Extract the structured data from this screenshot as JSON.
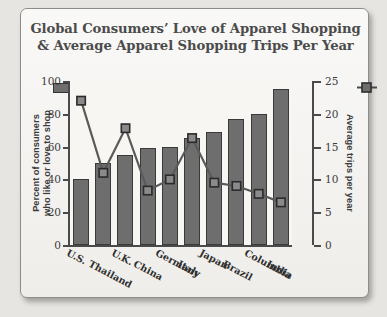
{
  "chart_data": {
    "type": "bar",
    "title": "Global Consumers’ Love of Apparel Shopping & Average Apparel Shopping Trips Per Year",
    "title_line1": "Global Consumers’ Love of Apparel Shopping",
    "title_line2": "& Average Apparel Shopping Trips Per Year",
    "categories": [
      "U.S.",
      "Thailand",
      "U.K.",
      "China",
      "Germany",
      "Italy",
      "Japan",
      "Brazil",
      "Columbia",
      "India"
    ],
    "series": [
      {
        "name": "Percent of consumers who like or love to shop",
        "type": "bar",
        "axis": "left",
        "color": "#6e6e6e",
        "values": [
          40,
          50,
          55,
          59,
          60,
          65,
          69,
          77,
          80,
          95
        ]
      },
      {
        "name": "Average trips per year",
        "type": "line",
        "axis": "right",
        "color": "#5a5a5a",
        "values": [
          22,
          11,
          17.8,
          8.3,
          10,
          16.3,
          9.5,
          9,
          7.8,
          6.5
        ]
      }
    ],
    "xlabel": "",
    "ylabel_left_line1": "Percent of consumers",
    "ylabel_left_line2": "who like or love to shop",
    "ylabel_right": "Average trips per year",
    "ylim_left": [
      0,
      100
    ],
    "ylim_right": [
      0,
      25
    ],
    "yticks_left": [
      "0",
      "20",
      "40",
      "60",
      "80",
      "100"
    ],
    "yticks_right": [
      "0",
      "5",
      "10",
      "15",
      "20",
      "25"
    ],
    "grid": false,
    "legend_position": "top",
    "legend": [
      {
        "label": "bar-series-swatch",
        "marker": "filled-square"
      },
      {
        "label": "line-series-swatch",
        "marker": "square-with-line"
      }
    ]
  },
  "colors": {
    "bar_fill": "#6e6e6e",
    "bar_stroke": "#3a3a3a",
    "line": "#5a5a5a",
    "axis": "#4a4a4a",
    "title_text": "#4b4b4b",
    "plot_bg": "#f7f6f3",
    "card_bg": "#f2f1ee",
    "page_bg": "#e6e5e2"
  }
}
